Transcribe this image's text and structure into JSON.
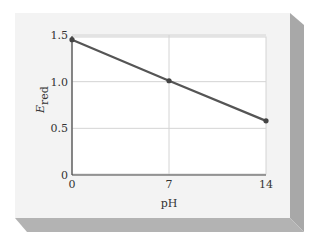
{
  "chart_data": {
    "type": "line",
    "title": "",
    "xlabel": "pH",
    "ylabel": "E",
    "ylabel_subscript": "red",
    "x": [
      0,
      7,
      14
    ],
    "series": [
      {
        "name": "E_red",
        "values": [
          1.45,
          1.01,
          0.58
        ]
      }
    ],
    "xlim": [
      0,
      14
    ],
    "ylim": [
      0,
      1.5
    ],
    "xticks": [
      "0",
      "7",
      "14"
    ],
    "yticks": [
      "0",
      "0.5",
      "1.0",
      "1.5"
    ],
    "grid": true,
    "legend": null
  },
  "colors": {
    "card_face": "#f3f3f3",
    "card_side": "#a8a8a8",
    "card_bottom": "#b3b3b3",
    "plot_bg": "#ffffff",
    "grid": "#d4d4d4",
    "line": "#555555",
    "axis": "#444444"
  }
}
